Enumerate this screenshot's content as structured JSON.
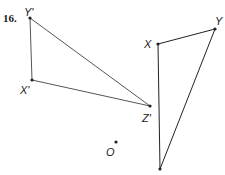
{
  "problem_number": "16.",
  "points": {
    "Yp": {
      "label": "Y'",
      "x": 30,
      "y": 18
    },
    "Xp": {
      "label": "X'",
      "x": 32,
      "y": 80
    },
    "Zp": {
      "label": "Z'",
      "x": 150,
      "y": 106
    },
    "X": {
      "label": "X",
      "x": 158,
      "y": 44
    },
    "Y": {
      "label": "Y",
      "x": 215,
      "y": 29
    },
    "Z": {
      "label": "",
      "x": 160,
      "y": 169
    },
    "O": {
      "label": "O",
      "x": 116,
      "y": 142
    }
  },
  "triangles": [
    {
      "name": "image-triangle",
      "vertices": [
        "X'",
        "Y'",
        "Z'"
      ]
    },
    {
      "name": "preimage-triangle",
      "vertices": [
        "X",
        "Y",
        "Z"
      ]
    }
  ],
  "colors": {
    "line_image": "#555555",
    "line_preimage": "#222222",
    "point": "#222222"
  }
}
